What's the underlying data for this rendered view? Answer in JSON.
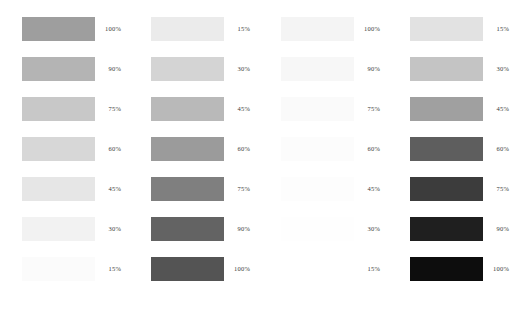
{
  "chart_data": {
    "type": "bar",
    "title": "",
    "subtitle": "",
    "xlabel": "",
    "ylabel": "",
    "grid": false,
    "legend_position": "none",
    "orientation": "horizontal",
    "background_color": "#ffffff",
    "label_color": "#3a3a3a",
    "swatch_width_px": 73,
    "swatch_height_px": 24,
    "row_pitch_px": 40,
    "categories": [
      "100%",
      "90%",
      "75%",
      "60%",
      "45%",
      "30%",
      "15%"
    ],
    "series": [
      {
        "name": "column-1",
        "order": "descending",
        "values": [
          100,
          90,
          75,
          60,
          45,
          30,
          15
        ],
        "labels": [
          "100%",
          "90%",
          "75%",
          "60%",
          "45%",
          "30%",
          "15%"
        ],
        "colors": [
          "#9e9e9e",
          "#b4b4b4",
          "#c8c8c8",
          "#d7d7d7",
          "#e6e6e6",
          "#f2f2f2",
          "#fbfbfb"
        ]
      },
      {
        "name": "column-2",
        "order": "ascending",
        "values": [
          15,
          30,
          45,
          60,
          75,
          90,
          100
        ],
        "labels": [
          "15%",
          "30%",
          "45%",
          "60%",
          "75%",
          "90%",
          "100%"
        ],
        "colors": [
          "#ebebeb",
          "#d4d4d4",
          "#b9b9b9",
          "#9b9b9b",
          "#7f7f7f",
          "#636363",
          "#545454"
        ]
      },
      {
        "name": "column-3",
        "order": "descending",
        "values": [
          100,
          90,
          75,
          60,
          45,
          30,
          15
        ],
        "labels": [
          "100%",
          "90%",
          "75%",
          "60%",
          "45%",
          "30%",
          "15%"
        ],
        "colors": [
          "#f4f4f4",
          "#f7f7f7",
          "#fafafa",
          "#fcfcfc",
          "#fdfdfd",
          "#fefefe",
          "#ffffff"
        ]
      },
      {
        "name": "column-4",
        "order": "ascending",
        "values": [
          15,
          30,
          45,
          60,
          75,
          90,
          100
        ],
        "labels": [
          "15%",
          "30%",
          "45%",
          "60%",
          "75%",
          "90%",
          "100%"
        ],
        "colors": [
          "#e2e2e2",
          "#c4c4c4",
          "#a0a0a0",
          "#5e5e5e",
          "#3c3c3c",
          "#1f1f1f",
          "#0d0d0d"
        ]
      }
    ]
  },
  "columns": [
    {
      "id": "column-1",
      "left_px": 0,
      "rows": [
        {
          "label": "100%",
          "color": "#9e9e9e",
          "top_px": 17
        },
        {
          "label": "90%",
          "color": "#b4b4b4",
          "top_px": 57
        },
        {
          "label": "75%",
          "color": "#c8c8c8",
          "top_px": 97
        },
        {
          "label": "60%",
          "color": "#d7d7d7",
          "top_px": 137
        },
        {
          "label": "45%",
          "color": "#e6e6e6",
          "top_px": 177
        },
        {
          "label": "30%",
          "color": "#f2f2f2",
          "top_px": 217
        },
        {
          "label": "15%",
          "color": "#fbfbfb",
          "top_px": 257
        }
      ]
    },
    {
      "id": "column-2",
      "left_px": 129,
      "rows": [
        {
          "label": "15%",
          "color": "#ebebeb",
          "top_px": 17
        },
        {
          "label": "30%",
          "color": "#d4d4d4",
          "top_px": 57
        },
        {
          "label": "45%",
          "color": "#b9b9b9",
          "top_px": 97
        },
        {
          "label": "60%",
          "color": "#9b9b9b",
          "top_px": 137
        },
        {
          "label": "75%",
          "color": "#7f7f7f",
          "top_px": 177
        },
        {
          "label": "90%",
          "color": "#636363",
          "top_px": 217
        },
        {
          "label": "100%",
          "color": "#545454",
          "top_px": 257
        }
      ]
    },
    {
      "id": "column-3",
      "left_px": 259,
      "rows": [
        {
          "label": "100%",
          "color": "#f4f4f4",
          "top_px": 17
        },
        {
          "label": "90%",
          "color": "#f7f7f7",
          "top_px": 57
        },
        {
          "label": "75%",
          "color": "#fafafa",
          "top_px": 97
        },
        {
          "label": "60%",
          "color": "#fcfcfc",
          "top_px": 137
        },
        {
          "label": "45%",
          "color": "#fdfdfd",
          "top_px": 177
        },
        {
          "label": "30%",
          "color": "#fefefe",
          "top_px": 217
        },
        {
          "label": "15%",
          "color": "#ffffff",
          "top_px": 257
        }
      ]
    },
    {
      "id": "column-4",
      "left_px": 388,
      "rows": [
        {
          "label": "15%",
          "color": "#e2e2e2",
          "top_px": 17
        },
        {
          "label": "30%",
          "color": "#c4c4c4",
          "top_px": 57
        },
        {
          "label": "45%",
          "color": "#a0a0a0",
          "top_px": 97
        },
        {
          "label": "60%",
          "color": "#5e5e5e",
          "top_px": 137
        },
        {
          "label": "75%",
          "color": "#3c3c3c",
          "top_px": 177
        },
        {
          "label": "90%",
          "color": "#1f1f1f",
          "top_px": 217
        },
        {
          "label": "100%",
          "color": "#0d0d0d",
          "top_px": 257
        }
      ]
    }
  ]
}
